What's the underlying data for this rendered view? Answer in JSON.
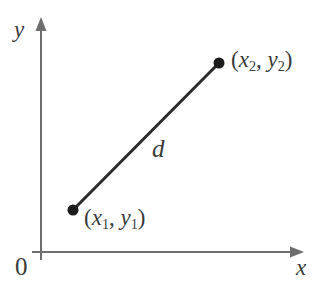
{
  "figure": {
    "background_color": "#ffffff",
    "width": 324,
    "height": 290
  },
  "axes": {
    "color": "#6e6e6e",
    "stroke_width": 2,
    "origin_label": "0",
    "x_axis": {
      "label": "x",
      "label_style": "italic",
      "start": [
        41,
        252
      ],
      "end": [
        303,
        252
      ],
      "arrow": "right"
    },
    "y_axis": {
      "label": "y",
      "label_style": "italic",
      "start": [
        41,
        260
      ],
      "end": [
        41,
        18
      ],
      "arrow": "up"
    }
  },
  "segment": {
    "color": "#2b2b2b",
    "stroke_width": 3,
    "length_label": "d",
    "length_label_style": "italic",
    "from": [
      73,
      210
    ],
    "to": [
      219,
      63
    ]
  },
  "points": [
    {
      "name": "point-1",
      "cx": 73,
      "cy": 210,
      "r": 5,
      "color": "#1c1c1c",
      "label": {
        "open_paren": "(",
        "x_var": "x",
        "x_sub": "1",
        "comma": ", ",
        "y_var": "y",
        "y_sub": "1",
        "close_paren": ")"
      }
    },
    {
      "name": "point-2",
      "cx": 219,
      "cy": 63,
      "r": 5,
      "color": "#1c1c1c",
      "label": {
        "open_paren": "(",
        "x_var": "x",
        "x_sub": "2",
        "comma": ", ",
        "y_var": "y",
        "y_sub": "2",
        "close_paren": ")"
      }
    }
  ]
}
